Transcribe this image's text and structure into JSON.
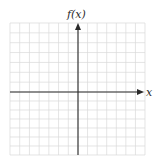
{
  "diagram": {
    "type": "coordinate-grid",
    "y_axis_label": "f(x)",
    "x_axis_label": "x",
    "grid": {
      "columns": 14,
      "rows": 14,
      "columns_left_of_y_axis": 7,
      "rows_above_x_axis": 7
    },
    "colors": {
      "grid": "#d9d9d9",
      "axis": "#2a2a2a",
      "background": "#ffffff"
    }
  }
}
